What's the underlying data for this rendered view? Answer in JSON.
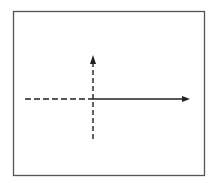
{
  "diagram": {
    "colors": {
      "background": "#ffffff",
      "frame": "#555555",
      "lines": "#222222"
    },
    "frame": {
      "x": 13,
      "y": 11,
      "width": 191,
      "height": 164
    },
    "origin": {
      "x": 93,
      "y": 99
    },
    "horizontal_axis": {
      "dashed_segment": {
        "x1": 25,
        "x2": 93
      },
      "solid_segment": {
        "x1": 93,
        "x2": 189
      },
      "arrow": "right"
    },
    "vertical_axis": {
      "dashed": true,
      "y_top": 56,
      "y_bottom": 139,
      "arrow": "up"
    }
  }
}
